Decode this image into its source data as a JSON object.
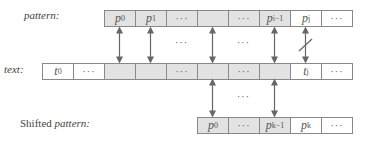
{
  "labels": {
    "pattern": "pattern:",
    "text": "text:",
    "shifted_prefix": "Shifted ",
    "shifted_italic": "pattern:"
  },
  "rows": {
    "pattern": [
      {
        "var": "p",
        "sub": "0",
        "fill": "gray"
      },
      {
        "var": "p",
        "sub": "1",
        "fill": "gray"
      },
      {
        "dots": "···",
        "fill": "gray"
      },
      {
        "var": "",
        "sub": "",
        "fill": "gray"
      },
      {
        "dots": "···",
        "fill": "gray"
      },
      {
        "var": "p",
        "sub": "i−1",
        "fill": "gray"
      },
      {
        "var": "p",
        "sub": "j",
        "fill": "white"
      },
      {
        "dots": "···",
        "fill": "white"
      }
    ],
    "text": [
      {
        "var": "t",
        "sub": "0",
        "fill": "white"
      },
      {
        "dots": "···",
        "fill": "white"
      },
      {
        "var": "",
        "sub": "",
        "fill": "gray"
      },
      {
        "var": "",
        "sub": "",
        "fill": "gray"
      },
      {
        "dots": "···",
        "fill": "gray"
      },
      {
        "var": "",
        "sub": "",
        "fill": "gray"
      },
      {
        "dots": "···",
        "fill": "gray"
      },
      {
        "var": "",
        "sub": "",
        "fill": "gray"
      },
      {
        "var": "t",
        "sub": "j",
        "fill": "white"
      },
      {
        "dots": "···",
        "fill": "white"
      }
    ],
    "shifted": [
      {
        "var": "p",
        "sub": "0",
        "fill": "gray"
      },
      {
        "dots": "···",
        "fill": "gray"
      },
      {
        "var": "p",
        "sub": "k−1",
        "fill": "gray"
      },
      {
        "var": "p",
        "sub": "k",
        "fill": "white"
      },
      {
        "dots": "···",
        "fill": "white"
      }
    ]
  },
  "between_dots": "···",
  "colors": {
    "match_fill": "#e2e2e2",
    "border": "#888888",
    "arrow": "#666666"
  }
}
